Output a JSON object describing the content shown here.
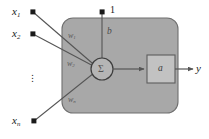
{
  "figure": {
    "colors": {
      "panel_fill": "#a8a8a8",
      "panel_stroke": "#6f6f6f",
      "box_fill": "#c2c2c2",
      "box_stroke": "#5d5d5d",
      "circle_fill": "#b5b5b5",
      "circle_stroke": "#3d3d3d",
      "line": "#555555",
      "dot": "#1a1a1a",
      "text": "#1a1a1a",
      "background": "#ffffff"
    },
    "inputs": [
      {
        "label": "x",
        "sub": "1"
      },
      {
        "label": "x",
        "sub": "2"
      },
      {
        "label": "x",
        "sub": "n"
      }
    ],
    "weights": [
      {
        "label": "w",
        "sub": "1"
      },
      {
        "label": "w",
        "sub": "2"
      },
      {
        "label": "w",
        "sub": "n"
      }
    ],
    "bias_input_label": "1",
    "bias_weight_label": "b",
    "summation_symbol": "Σ",
    "activation_label": "a",
    "output_label": "y",
    "ellipsis": "⋮"
  }
}
